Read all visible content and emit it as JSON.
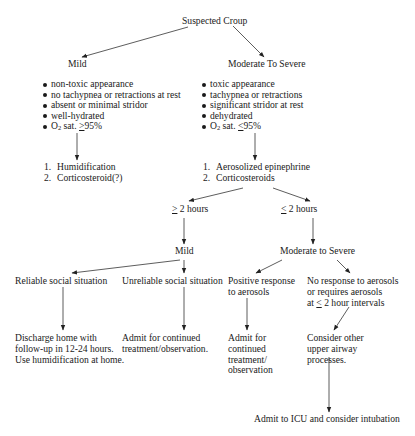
{
  "root": {
    "label": "Suspected Croup"
  },
  "mild": {
    "label": "Mild",
    "criteria": [
      "non-toxic appearance",
      "no tachypnea or retractions at rest",
      "absent or minimal stridor",
      "well-hydrated"
    ],
    "o2": {
      "prefix": "O",
      "sub": "2",
      "text": " sat. ",
      "symbol": ">",
      "value": "95%"
    },
    "treatment": [
      {
        "num": "1.",
        "text": "Humidification"
      },
      {
        "num": "2.",
        "text": "Corticosteroid(?)"
      }
    ]
  },
  "severe": {
    "label": "Moderate To Severe",
    "criteria": [
      "toxic appearance",
      "tachypnea or retractions",
      "significant stridor at rest",
      "dehydrated"
    ],
    "o2": {
      "prefix": "O",
      "sub": "2",
      "text": " sat. ",
      "symbol": "<",
      "value": "95%"
    },
    "treatment": [
      {
        "num": "1.",
        "text": "Aerosolized epinephrine"
      },
      {
        "num": "2.",
        "text": "Corticosteroids"
      }
    ]
  },
  "time_branches": {
    "ge": {
      "symbol": ">",
      "text": " 2 hours"
    },
    "le": {
      "symbol": "<",
      "text": " 2 hours"
    }
  },
  "outcome": {
    "mild": "Mild",
    "severe": "Moderate to Severe"
  },
  "leaves": {
    "reliable": "Reliable social situation",
    "unreliable": "Unreliable social situation",
    "positive": "Positive response\nto aerosols",
    "no_response_1": "No response to aerosols\nor requires aerosols\nat ",
    "no_response_sym": "<",
    "no_response_2": " 2 hour intervals"
  },
  "actions": {
    "discharge": "Discharge home with\nfollow-up in 12-24 hours.\nUse humidification at home.",
    "admit_unreliable": "Admit for continued\ntreatment/observation.",
    "admit_positive": "Admit for\ncontinued\ntreatment/\nobservation",
    "consider": "Consider other\nupper airway\nprocesses.",
    "icu": "Admit to ICU and consider intubation"
  }
}
